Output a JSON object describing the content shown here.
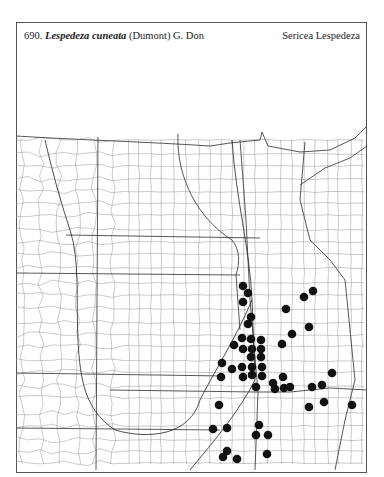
{
  "header": {
    "number": "690.",
    "scientific_name": "Lespedeza cuneata",
    "authority": "(Dumont) G. Don",
    "common_name": "Sericea Lespedeza"
  },
  "map": {
    "region": "Great Plains counties (distribution map)",
    "line_color": "#555555",
    "dot_color": "#111111",
    "dot_radius": 4.3,
    "occurrence_dots": [
      [
        243,
        286
      ],
      [
        248,
        293
      ],
      [
        243,
        302
      ],
      [
        251,
        317
      ],
      [
        248,
        324
      ],
      [
        313,
        291
      ],
      [
        304,
        297
      ],
      [
        286,
        309
      ],
      [
        309,
        327
      ],
      [
        292,
        334
      ],
      [
        282,
        344
      ],
      [
        242,
        338
      ],
      [
        251,
        339
      ],
      [
        261,
        340
      ],
      [
        234,
        345
      ],
      [
        243,
        349
      ],
      [
        252,
        349
      ],
      [
        261,
        349
      ],
      [
        251,
        357
      ],
      [
        261,
        357
      ],
      [
        222,
        363
      ],
      [
        232,
        369
      ],
      [
        242,
        367
      ],
      [
        252,
        367
      ],
      [
        262,
        367
      ],
      [
        221,
        377
      ],
      [
        243,
        377
      ],
      [
        252,
        375
      ],
      [
        262,
        376
      ],
      [
        256,
        387
      ],
      [
        283,
        377
      ],
      [
        273,
        383
      ],
      [
        275,
        389
      ],
      [
        284,
        388
      ],
      [
        290,
        387
      ],
      [
        312,
        387
      ],
      [
        322,
        385
      ],
      [
        332,
        373
      ],
      [
        219,
        405
      ],
      [
        309,
        407
      ],
      [
        324,
        402
      ],
      [
        352,
        405
      ],
      [
        213,
        429
      ],
      [
        227,
        428
      ],
      [
        259,
        425
      ],
      [
        256,
        435
      ],
      [
        268,
        435
      ],
      [
        227,
        451
      ],
      [
        223,
        457
      ],
      [
        237,
        459
      ],
      [
        267,
        454
      ]
    ]
  }
}
